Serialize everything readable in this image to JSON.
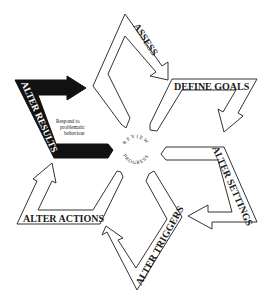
{
  "diagram": {
    "type": "cycle",
    "center": {
      "label_top": "REVIEW",
      "label_bottom": "PROGRESS"
    },
    "steps": [
      {
        "id": "assess",
        "label": "ASSESS",
        "style": "outline"
      },
      {
        "id": "define-goals",
        "label": "DEFINE GOALS",
        "style": "outline"
      },
      {
        "id": "alter-settings",
        "label": "ALTER SETTINGS",
        "style": "outline"
      },
      {
        "id": "alter-triggers",
        "label": "ALTER TRIGGERS",
        "style": "outline"
      },
      {
        "id": "alter-actions",
        "label": "ALTER ACTIONS",
        "style": "outline"
      },
      {
        "id": "alter-results",
        "label": "ALTER RESULTS",
        "style": "filled"
      }
    ],
    "annotation": {
      "line1": "Respond to",
      "line2": "problematic",
      "line3": "behaviour"
    },
    "colors": {
      "stroke": "#333333",
      "fill_outline": "#ffffff",
      "fill_filled": "#111111",
      "text": "#1a1a1a"
    }
  }
}
